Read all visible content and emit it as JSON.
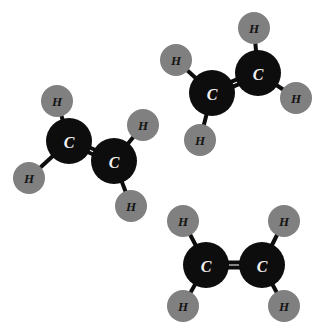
{
  "canvas": {
    "width": 323,
    "height": 331,
    "background": "#ffffff"
  },
  "palette": {
    "carbon_fill": "#0d0d0d",
    "carbon_label_color": "#f2f2f2",
    "hydrogen_fill": "#808080",
    "hydrogen_label_color": "#141414",
    "bond_color": "#0d0d0d"
  },
  "legend": {
    "carbon_symbol": "C",
    "hydrogen_symbol": "H",
    "molecule_name": "ethene",
    "molecular_formula": "C2H4"
  },
  "molecules": [
    {
      "id": "molecule-1",
      "name": "ethene-left",
      "formula": "C2H4",
      "atoms": [
        {
          "id": "m1-c1",
          "element": "C",
          "symbol": "C",
          "cx": 69,
          "cy": 141,
          "r": 23
        },
        {
          "id": "m1-c2",
          "element": "C",
          "symbol": "C",
          "cx": 114,
          "cy": 161,
          "r": 23
        },
        {
          "id": "m1-h1",
          "element": "H",
          "symbol": "H",
          "cx": 57,
          "cy": 101,
          "r": 16
        },
        {
          "id": "m1-h2",
          "element": "H",
          "symbol": "H",
          "cx": 29,
          "cy": 178,
          "r": 16
        },
        {
          "id": "m1-h3",
          "element": "H",
          "symbol": "H",
          "cx": 143,
          "cy": 125,
          "r": 16
        },
        {
          "id": "m1-h4",
          "element": "H",
          "symbol": "H",
          "cx": 131,
          "cy": 206,
          "r": 16
        }
      ],
      "bonds": [
        {
          "id": "m1-b1",
          "from": "m1-c1",
          "to": "m1-c2",
          "order": 2,
          "width": 4,
          "gap": 5
        },
        {
          "id": "m1-b2",
          "from": "m1-c1",
          "to": "m1-h1",
          "order": 1,
          "width": 4
        },
        {
          "id": "m1-b3",
          "from": "m1-c1",
          "to": "m1-h2",
          "order": 1,
          "width": 4
        },
        {
          "id": "m1-b4",
          "from": "m1-c2",
          "to": "m1-h3",
          "order": 1,
          "width": 4
        },
        {
          "id": "m1-b5",
          "from": "m1-c2",
          "to": "m1-h4",
          "order": 1,
          "width": 4
        }
      ]
    },
    {
      "id": "molecule-2",
      "name": "ethene-top-right",
      "formula": "C2H4",
      "atoms": [
        {
          "id": "m2-c1",
          "element": "C",
          "symbol": "C",
          "cx": 212,
          "cy": 93,
          "r": 23
        },
        {
          "id": "m2-c2",
          "element": "C",
          "symbol": "C",
          "cx": 258,
          "cy": 73,
          "r": 23
        },
        {
          "id": "m2-h1",
          "element": "H",
          "symbol": "H",
          "cx": 176,
          "cy": 60,
          "r": 16
        },
        {
          "id": "m2-h2",
          "element": "H",
          "symbol": "H",
          "cx": 200,
          "cy": 140,
          "r": 16
        },
        {
          "id": "m2-h3",
          "element": "H",
          "symbol": "H",
          "cx": 254,
          "cy": 28,
          "r": 16
        },
        {
          "id": "m2-h4",
          "element": "H",
          "symbol": "H",
          "cx": 296,
          "cy": 98,
          "r": 16
        }
      ],
      "bonds": [
        {
          "id": "m2-b1",
          "from": "m2-c1",
          "to": "m2-c2",
          "order": 2,
          "width": 4,
          "gap": 5
        },
        {
          "id": "m2-b2",
          "from": "m2-c1",
          "to": "m2-h1",
          "order": 1,
          "width": 4
        },
        {
          "id": "m2-b3",
          "from": "m2-c1",
          "to": "m2-h2",
          "order": 1,
          "width": 4
        },
        {
          "id": "m2-b4",
          "from": "m2-c2",
          "to": "m2-h3",
          "order": 1,
          "width": 4
        },
        {
          "id": "m2-b5",
          "from": "m2-c2",
          "to": "m2-h4",
          "order": 1,
          "width": 4
        }
      ]
    },
    {
      "id": "molecule-3",
      "name": "ethene-bottom-right",
      "formula": "C2H4",
      "atoms": [
        {
          "id": "m3-c1",
          "element": "C",
          "symbol": "C",
          "cx": 206,
          "cy": 265,
          "r": 23
        },
        {
          "id": "m3-c2",
          "element": "C",
          "symbol": "C",
          "cx": 262,
          "cy": 265,
          "r": 23
        },
        {
          "id": "m3-h1",
          "element": "H",
          "symbol": "H",
          "cx": 183,
          "cy": 221,
          "r": 16
        },
        {
          "id": "m3-h2",
          "element": "H",
          "symbol": "H",
          "cx": 183,
          "cy": 306,
          "r": 16
        },
        {
          "id": "m3-h3",
          "element": "H",
          "symbol": "H",
          "cx": 284,
          "cy": 221,
          "r": 16
        },
        {
          "id": "m3-h4",
          "element": "H",
          "symbol": "H",
          "cx": 284,
          "cy": 306,
          "r": 16
        }
      ],
      "bonds": [
        {
          "id": "m3-b1",
          "from": "m3-c1",
          "to": "m3-c2",
          "order": 2,
          "width": 4,
          "gap": 5
        },
        {
          "id": "m3-b2",
          "from": "m3-c1",
          "to": "m3-h1",
          "order": 1,
          "width": 4
        },
        {
          "id": "m3-b3",
          "from": "m3-c1",
          "to": "m3-h2",
          "order": 1,
          "width": 4
        },
        {
          "id": "m3-b4",
          "from": "m3-c2",
          "to": "m3-h3",
          "order": 1,
          "width": 4
        },
        {
          "id": "m3-b5",
          "from": "m3-c2",
          "to": "m3-h4",
          "order": 1,
          "width": 4
        }
      ]
    }
  ]
}
